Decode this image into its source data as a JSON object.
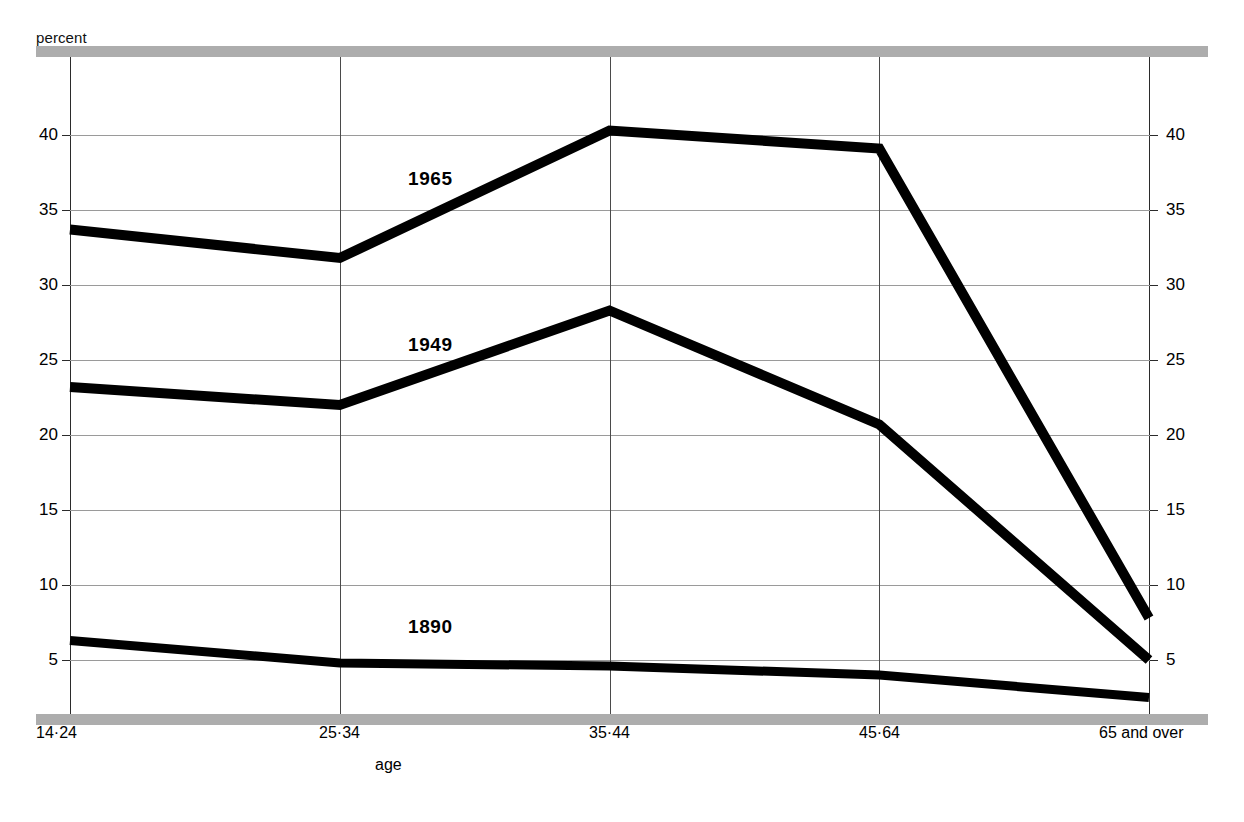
{
  "figure": {
    "unit_caption": "percent",
    "xaxis_title": "age",
    "rail_color": "#adadad",
    "line_color": "#000000",
    "gridline_color": "#9a9a9a"
  },
  "chart_data": {
    "type": "line",
    "title": "",
    "subtitle": "",
    "xlabel": "age",
    "ylabel": "percent",
    "categories": [
      "14-24",
      "25-34",
      "35-44",
      "45-64",
      "65 and over"
    ],
    "category_labels": [
      "14·24",
      "25·34",
      "35·44",
      "45·64",
      "65 and over"
    ],
    "ylim": [
      0,
      44
    ],
    "yticks": [
      5,
      10,
      15,
      20,
      25,
      30,
      35,
      40
    ],
    "ytick_labels_left": [
      "5",
      "10",
      "15",
      "20",
      "25",
      "30",
      "35",
      "40"
    ],
    "ytick_labels_right": [
      "5",
      "10",
      "15",
      "20",
      "25",
      "30",
      "35",
      "40"
    ],
    "grid": "horizontal-and-vertical",
    "legend_position": "inline-annotation",
    "series": [
      {
        "name": "1965",
        "values": [
          33.7,
          31.8,
          40.3,
          39.1,
          7.8
        ]
      },
      {
        "name": "1949",
        "values": [
          23.2,
          22.0,
          28.3,
          20.7,
          5.0
        ]
      },
      {
        "name": "1890",
        "values": [
          6.3,
          4.8,
          4.6,
          4.0,
          2.5
        ]
      }
    ],
    "annotations": [
      {
        "text": "1965",
        "series": "1965"
      },
      {
        "text": "1949",
        "series": "1949"
      },
      {
        "text": "1890",
        "series": "1890"
      }
    ]
  }
}
